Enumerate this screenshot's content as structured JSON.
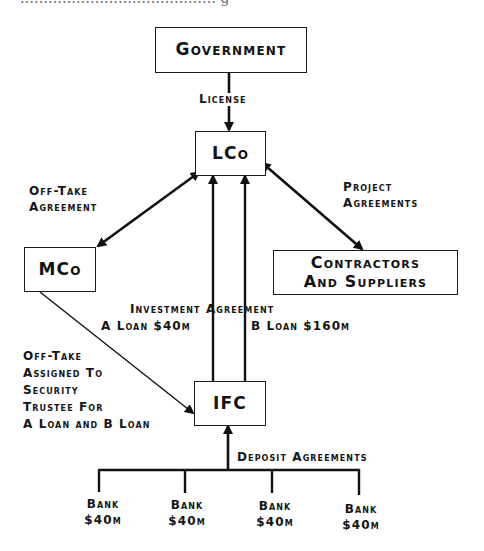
{
  "header_fragment": "…………………………………… g",
  "nodes": {
    "government": "Government",
    "lco": "LCo",
    "mco": "MCo",
    "contractors": [
      "Contractors",
      "And Suppliers"
    ],
    "ifc": "IFC",
    "banks": [
      {
        "name": "Bank",
        "amount": "$40m"
      },
      {
        "name": "Bank",
        "amount": "$40m"
      },
      {
        "name": "Bank",
        "amount": "$40m"
      },
      {
        "name": "Bank",
        "amount": "$40m"
      }
    ]
  },
  "edges": {
    "license": "License",
    "offtake_agreement": [
      "Off-Take",
      "Agreement"
    ],
    "project_agreements": [
      "Project",
      "Agreements"
    ],
    "investment_agreement": "Investment Agreement",
    "a_loan": "A Loan $40m",
    "b_loan": "B Loan $160m",
    "offtake_assigned": [
      "Off-Take",
      "Assigned To",
      "Security",
      "Trustee For",
      "A Loan and B Loan"
    ],
    "deposit_agreements": "Deposit Agreements"
  },
  "colors": {
    "ink": "#111111",
    "background": "#ffffff"
  }
}
